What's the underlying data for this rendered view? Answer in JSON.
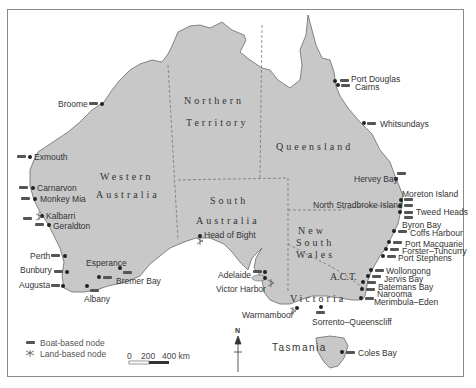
{
  "map": {
    "title": "",
    "colors": {
      "land": "#c8c8c8",
      "coast": "#6a6a6a",
      "border": "#6a6a6a",
      "marker": "#222222",
      "text": "#333333"
    }
  },
  "regions": {
    "wa_1": "Western",
    "wa_2": "Australia",
    "nt_1": "Northern",
    "nt_2": "Territory",
    "qld": "Queensland",
    "sa_1": "South",
    "sa_2": "Australia",
    "nsw_1": "New",
    "nsw_2": "South",
    "nsw_3": "Wales",
    "act": "A.C.T.",
    "vic": "Victoria",
    "tas": "Tasmania"
  },
  "places": {
    "broome": "Broome",
    "exmouth": "Exmouth",
    "carnarvon": "Carnarvon",
    "monkey_mia": "Monkey Mia",
    "kalbarri": "Kalbarri",
    "geraldton": "Geraldton",
    "perth": "Perth",
    "bunbury": "Bunbury",
    "augusta": "Augusta",
    "albany": "Albany",
    "esperance": "Esperance",
    "bremer_bay": "Bremer Bay",
    "head_of_bight": "Head of Bight",
    "adelaide": "Adelaide",
    "victor_harbor": "Victor Harbor",
    "warrnambool": "Warrnambool",
    "sorrento": "Sorrento–Queenscliff",
    "coles_bay": "Coles Bay",
    "merimbula": "Merimbula–Eden",
    "narooma": "Narooma",
    "batemans_bay": "Batemans Bay",
    "jervis_bay": "Jervis Bay",
    "wollongong": "Wollongong",
    "port_stephens": "Port Stephens",
    "forster": "Forster–Tuncurry",
    "port_macquarie": "Port Macquarie",
    "coffs_harbour": "Coffs Harbour",
    "byron_bay": "Byron Bay",
    "tweed_heads": "Tweed Heads",
    "north_stradbroke": "North Stradbroke Island",
    "moreton_island": "Moreton Island",
    "hervey_bay": "Hervey Bay",
    "whitsundays": "Whitsundays",
    "cairns": "Cairns",
    "port_douglas": "Port Douglas"
  },
  "legend": {
    "boat": "Boat-based node",
    "land": "Land-based node",
    "boat_icon": "boat-icon",
    "land_icon": "land-node-icon"
  },
  "scale": {
    "zero": "0",
    "mid": "200",
    "max": "400 km"
  },
  "north": {
    "label": "N"
  }
}
